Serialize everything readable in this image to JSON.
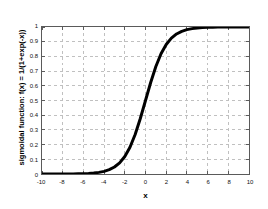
{
  "chart_data": {
    "type": "line",
    "title": "",
    "xlabel": "x",
    "ylabel": "sigmoidal function: f(x) = 1/(1+exp(-x))",
    "xlim": [
      -10,
      10
    ],
    "ylim": [
      0,
      1
    ],
    "grid": true,
    "legend": false,
    "line_color": "#000000",
    "line_width": 3,
    "grid_color": "#bfbfbf",
    "axis_color": "#5a5a5a",
    "background": "#ffffff",
    "xticks": [
      -10,
      -8,
      -6,
      -4,
      -2,
      0,
      2,
      4,
      6,
      8,
      10
    ],
    "xtick_labels": [
      "-10",
      "-8",
      "-6",
      "-4",
      "-2",
      "0",
      "2",
      "4",
      "6",
      "8",
      "10"
    ],
    "yticks": [
      0,
      0.1,
      0.2,
      0.3,
      0.4,
      0.5,
      0.6,
      0.7,
      0.8,
      0.9,
      1
    ],
    "ytick_labels": [
      "0",
      "0.1",
      "0.2",
      "0.3",
      "0.4",
      "0.5",
      "0.6",
      "0.7",
      "0.8",
      "0.9",
      "1"
    ],
    "series": [
      {
        "name": "sigmoid",
        "x": [
          -10,
          -9.5,
          -9,
          -8.5,
          -8,
          -7.5,
          -7,
          -6.5,
          -6,
          -5.5,
          -5,
          -4.5,
          -4,
          -3.5,
          -3,
          -2.5,
          -2,
          -1.5,
          -1,
          -0.5,
          0,
          0.5,
          1,
          1.5,
          2,
          2.5,
          3,
          3.5,
          4,
          4.5,
          5,
          5.5,
          6,
          6.5,
          7,
          7.5,
          8,
          8.5,
          9,
          9.5,
          10
        ],
        "y": [
          4.54e-05,
          7.49e-05,
          0.0001234,
          0.0002035,
          0.0003354,
          0.0005527,
          0.0009111,
          0.0015012,
          0.0024726,
          0.0040701,
          0.0066929,
          0.0109869,
          0.0179862,
          0.0293122,
          0.0474259,
          0.0758582,
          0.1192029,
          0.1824255,
          0.2689414,
          0.3775407,
          0.5,
          0.6224593,
          0.7310586,
          0.8175745,
          0.8807971,
          0.9241418,
          0.9525741,
          0.9706877,
          0.9820138,
          0.9890131,
          0.9933071,
          0.9959299,
          0.9975274,
          0.9984988,
          0.9990889,
          0.9994473,
          0.9996646,
          0.9997965,
          0.9998766,
          0.9999251,
          0.9999546
        ]
      }
    ]
  }
}
